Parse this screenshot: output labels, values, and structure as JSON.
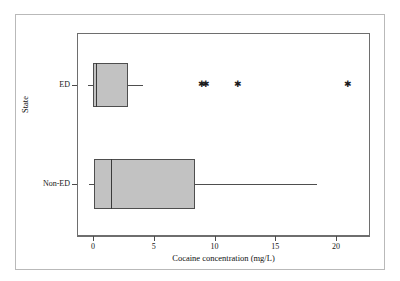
{
  "figure": {
    "caption_remnant_left": "",
    "caption_remnant_center": "",
    "background": "#ffffff",
    "box_fill": "#c2c2c2",
    "line_color": "#4e4e4e",
    "frame_color": "#6e6e6e",
    "outer_border_color": "#b9b9b9"
  },
  "axes": {
    "x_title": "Cocaine concentration (mg/L)",
    "y_title": "State",
    "x_ticks": [
      "0",
      "5",
      "10",
      "15",
      "20"
    ],
    "x_tick_values": [
      0,
      5,
      10,
      15,
      20
    ],
    "y_categories": [
      "ED",
      "Non-ED"
    ]
  },
  "chart_data": {
    "type": "box",
    "title": "",
    "subtitle": "",
    "xlabel": "Cocaine concentration (mg/L)",
    "ylabel": "State",
    "orientation": "horizontal",
    "xlim": [
      -1.2,
      22.8
    ],
    "xticks": [
      0,
      5,
      10,
      15,
      20
    ],
    "grid": false,
    "legend": "none",
    "categories": [
      "ED",
      "Non-ED"
    ],
    "boxes": [
      {
        "name": "ED",
        "whisker_low": 0.0,
        "q1": 0.0,
        "median": 0.25,
        "q3": 2.9,
        "whisker_high": 4.1,
        "outliers": [
          9.0,
          9.3,
          11.9,
          21.0
        ]
      },
      {
        "name": "Non-ED",
        "whisker_low": 0.05,
        "q1": 0.1,
        "median": 1.5,
        "q3": 8.4,
        "whisker_high": 18.4,
        "outliers": []
      }
    ]
  }
}
